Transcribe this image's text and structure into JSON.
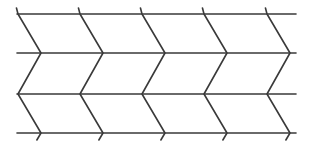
{
  "diagram": {
    "type": "zigzag-line-pattern",
    "width": 311,
    "height": 152,
    "stroke_color": "#3a3a3a",
    "background": "#ffffff",
    "stroke_width": 1.6,
    "rows_y": [
      14,
      53,
      94,
      133
    ],
    "line_x_start": 17,
    "line_x_end": 296,
    "left_vertices_x": [
      18,
      80,
      142,
      204,
      267
    ],
    "right_vertices_x": [
      41,
      103,
      165,
      227,
      290
    ],
    "top_tick_y": 8,
    "bottom_tick_y": 140
  }
}
